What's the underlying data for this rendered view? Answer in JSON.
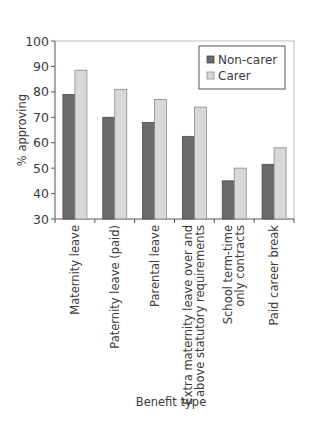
{
  "chart_data": {
    "type": "bar",
    "title": "",
    "xlabel": "Benefit type",
    "ylabel": "% approving",
    "ylim": [
      30,
      100
    ],
    "yticks": [
      30,
      40,
      50,
      60,
      70,
      80,
      90,
      100
    ],
    "grid": false,
    "legend_position": "upper right (inside plot)",
    "categories": [
      [
        "Maternity leave"
      ],
      [
        "Paternity leave (paid)"
      ],
      [
        "Parental leave"
      ],
      [
        "Extra maternity leave over and",
        "above statutory requirements"
      ],
      [
        "School term-time",
        "only contracts"
      ],
      [
        "Paid career break"
      ]
    ],
    "series": [
      {
        "name": "Non-carer",
        "color": "#6b6b6b",
        "values": [
          79,
          70,
          68,
          62.5,
          45,
          51.5
        ]
      },
      {
        "name": "Carer",
        "color": "#d8d8d8",
        "values": [
          88.5,
          81,
          77,
          74,
          50,
          58
        ]
      }
    ]
  }
}
